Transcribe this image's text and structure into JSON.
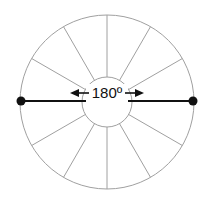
{
  "diagram": {
    "title": "",
    "angle_label": "180º",
    "center": [
      107,
      102
    ],
    "outer_radius": 87,
    "inner_radius": 25,
    "spoke_angles_deg": [
      30,
      60,
      90,
      120,
      150,
      210,
      240,
      270,
      300,
      330
    ],
    "diameter": {
      "from": [
        21,
        101
      ],
      "to": [
        193,
        101
      ]
    },
    "colors": {
      "circle": "#a0a0a0",
      "spokes": "#a0a0a0",
      "diameter": "#111111",
      "endpoints": "#111111",
      "text": "#111111"
    }
  }
}
